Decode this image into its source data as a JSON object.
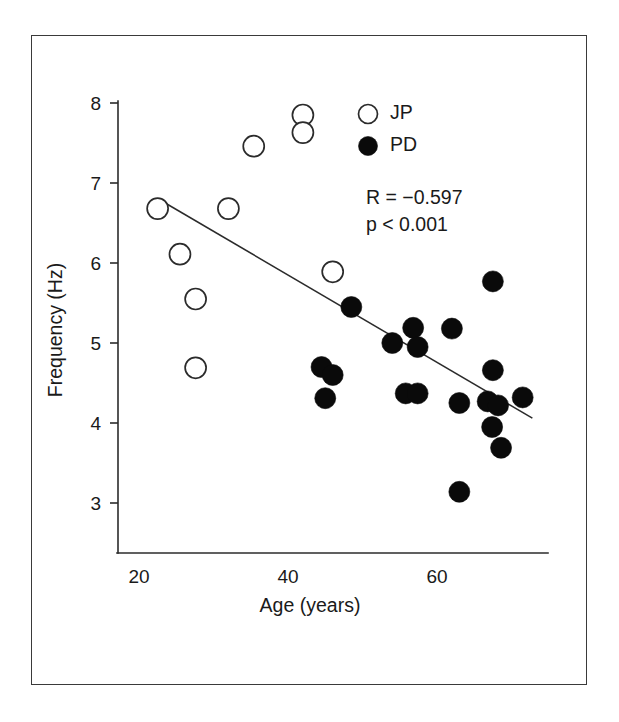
{
  "figure": {
    "frame_visible": true,
    "background_color": "#ffffff",
    "ink_color": "#1a1a1a"
  },
  "chart_data": {
    "type": "scatter",
    "title": "",
    "subtitle": "",
    "xlabel": "Age (years)",
    "ylabel": "Frequency (Hz)",
    "xlim": [
      18,
      74
    ],
    "ylim": [
      2.3,
      8.15
    ],
    "xticks": [
      20,
      40,
      60
    ],
    "xticklabels": [
      "20",
      "40",
      "60"
    ],
    "yticks": [
      3,
      4,
      5,
      6,
      7,
      8
    ],
    "yticklabels": [
      "3",
      "4",
      "5",
      "6",
      "7",
      "8"
    ],
    "grid": false,
    "legend_position": "top-right",
    "annotations": [
      "R = −0.597",
      "p < 0.001"
    ],
    "statistics": {
      "r_label": "R = −0.597",
      "r_value": -0.597,
      "p_label": "p < 0.001",
      "p_value": 0.001
    },
    "series": [
      {
        "name": "JP",
        "legend_label": "JP",
        "marker": "open-circle",
        "marker_fill": "#ffffff",
        "marker_edge": "#2b2b2b",
        "points": [
          {
            "x": 22.5,
            "y": 6.68
          },
          {
            "x": 25.5,
            "y": 6.11
          },
          {
            "x": 27.6,
            "y": 5.55
          },
          {
            "x": 27.6,
            "y": 4.69
          },
          {
            "x": 32.0,
            "y": 6.68
          },
          {
            "x": 35.4,
            "y": 7.46
          },
          {
            "x": 42.0,
            "y": 7.85
          },
          {
            "x": 42.0,
            "y": 7.63
          },
          {
            "x": 46.0,
            "y": 5.89
          }
        ]
      },
      {
        "name": "PD",
        "legend_label": "PD",
        "marker": "filled-circle",
        "marker_fill": "#0a0a0a",
        "marker_edge": "#0a0a0a",
        "points": [
          {
            "x": 48.5,
            "y": 5.45
          },
          {
            "x": 44.5,
            "y": 4.7
          },
          {
            "x": 46.0,
            "y": 4.6
          },
          {
            "x": 45.0,
            "y": 4.31
          },
          {
            "x": 54.0,
            "y": 5.0
          },
          {
            "x": 56.8,
            "y": 5.19
          },
          {
            "x": 57.4,
            "y": 4.95
          },
          {
            "x": 55.8,
            "y": 4.37
          },
          {
            "x": 57.4,
            "y": 4.37
          },
          {
            "x": 62.0,
            "y": 5.18
          },
          {
            "x": 67.5,
            "y": 5.77
          },
          {
            "x": 67.5,
            "y": 4.66
          },
          {
            "x": 63.0,
            "y": 4.25
          },
          {
            "x": 66.8,
            "y": 4.27
          },
          {
            "x": 68.2,
            "y": 4.22
          },
          {
            "x": 71.5,
            "y": 4.32
          },
          {
            "x": 67.4,
            "y": 3.95
          },
          {
            "x": 68.6,
            "y": 3.69
          },
          {
            "x": 63.0,
            "y": 3.14
          }
        ]
      }
    ],
    "trendline": {
      "name": "regression-line",
      "x_start": 22.6,
      "y_start": 6.8,
      "x_end": 72.8,
      "y_end": 4.06
    }
  }
}
